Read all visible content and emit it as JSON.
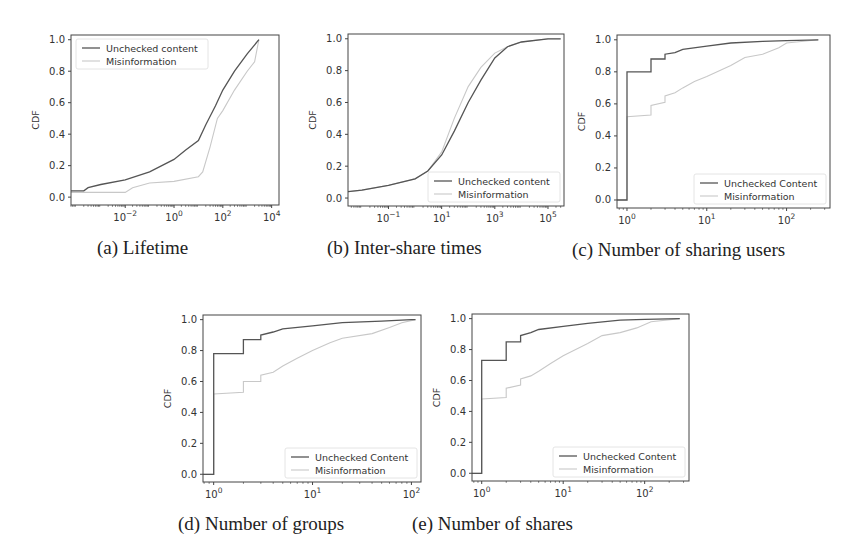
{
  "figure": {
    "colors": {
      "unchecked": "#555555",
      "misinformation": "#c8c8c8",
      "axis": "#444444",
      "background": "#ffffff"
    }
  },
  "chart_data": [
    {
      "id": "a",
      "type": "line",
      "caption": "(a) Lifetime",
      "title": "",
      "xlabel": "",
      "ylabel": "CDF",
      "xscale": "log",
      "xlim": [
        6e-05,
        20000
      ],
      "ylim": [
        -0.05,
        1.03
      ],
      "xticks": [
        "10^-2",
        "10^0",
        "10^2",
        "10^4"
      ],
      "yticks": [
        "0.0",
        "0.2",
        "0.4",
        "0.6",
        "0.8",
        "1.0"
      ],
      "legend": {
        "position": "upper left",
        "entries": [
          "Unchecked content",
          "Misinformation"
        ]
      },
      "grid": false,
      "series": [
        {
          "name": "Unchecked content",
          "x": [
            6e-05,
            0.0002,
            0.0003,
            0.001,
            0.01,
            0.1,
            1,
            3,
            10,
            20,
            50,
            100,
            300,
            1000,
            3000
          ],
          "y": [
            0.04,
            0.04,
            0.06,
            0.08,
            0.11,
            0.16,
            0.24,
            0.3,
            0.36,
            0.46,
            0.58,
            0.68,
            0.8,
            0.91,
            1.0
          ]
        },
        {
          "name": "Misinformation",
          "x": [
            6e-05,
            0.001,
            0.01,
            0.02,
            0.1,
            1,
            10,
            15,
            30,
            60,
            100,
            300,
            1000,
            2000,
            3000
          ],
          "y": [
            0.03,
            0.03,
            0.03,
            0.06,
            0.09,
            0.1,
            0.13,
            0.16,
            0.32,
            0.5,
            0.55,
            0.68,
            0.8,
            0.86,
            1.0
          ]
        }
      ]
    },
    {
      "id": "b",
      "type": "line",
      "caption": "(b) Inter-share times",
      "title": "",
      "xlabel": "",
      "ylabel": "CDF",
      "xscale": "log",
      "xlim": [
        0.003,
        400000
      ],
      "ylim": [
        -0.05,
        1.03
      ],
      "xticks": [
        "10^-1",
        "10^1",
        "10^3",
        "10^5"
      ],
      "yticks": [
        "0.0",
        "0.2",
        "0.4",
        "0.6",
        "0.8",
        "1.0"
      ],
      "legend": {
        "position": "lower right",
        "entries": [
          "Unchecked content",
          "Misinformation"
        ]
      },
      "grid": false,
      "series": [
        {
          "name": "Unchecked content",
          "x": [
            0.003,
            0.01,
            0.1,
            1,
            3,
            10,
            30,
            100,
            300,
            1000,
            3000,
            10000,
            100000,
            300000
          ],
          "y": [
            0.04,
            0.05,
            0.08,
            0.12,
            0.17,
            0.27,
            0.42,
            0.6,
            0.74,
            0.88,
            0.95,
            0.98,
            1.0,
            1.0
          ]
        },
        {
          "name": "Misinformation",
          "x": [
            0.003,
            0.01,
            0.1,
            1,
            3,
            10,
            30,
            100,
            300,
            1000,
            3000,
            10000,
            100000,
            300000
          ],
          "y": [
            0.04,
            0.05,
            0.08,
            0.12,
            0.17,
            0.29,
            0.5,
            0.7,
            0.82,
            0.91,
            0.95,
            0.98,
            1.0,
            1.0
          ]
        }
      ]
    },
    {
      "id": "c",
      "type": "line",
      "caption": "(c) Number of sharing users",
      "title": "",
      "xlabel": "",
      "ylabel": "CDF",
      "xscale": "log",
      "xlim": [
        0.75,
        350
      ],
      "ylim": [
        -0.05,
        1.03
      ],
      "xticks": [
        "10^0",
        "10^1",
        "10^2"
      ],
      "yticks": [
        "0.0",
        "0.2",
        "0.4",
        "0.6",
        "0.8",
        "1.0"
      ],
      "legend": {
        "position": "lower right",
        "entries": [
          "Unchecked Content",
          "Misinformation"
        ]
      },
      "grid": false,
      "series": [
        {
          "name": "Unchecked Content",
          "x": [
            0.75,
            1,
            1,
            2,
            2,
            3,
            3,
            4,
            5,
            10,
            20,
            50,
            100,
            250
          ],
          "y": [
            0.0,
            0.0,
            0.8,
            0.8,
            0.88,
            0.88,
            0.91,
            0.92,
            0.94,
            0.96,
            0.98,
            0.99,
            0.995,
            1.0
          ]
        },
        {
          "name": "Misinformation",
          "x": [
            0.75,
            1,
            1,
            2,
            2,
            3,
            3,
            4,
            5,
            7,
            10,
            20,
            30,
            50,
            80,
            100,
            250
          ],
          "y": [
            0.0,
            0.0,
            0.52,
            0.53,
            0.59,
            0.61,
            0.65,
            0.67,
            0.7,
            0.74,
            0.77,
            0.84,
            0.89,
            0.91,
            0.95,
            0.98,
            1.0
          ]
        }
      ]
    },
    {
      "id": "d",
      "type": "line",
      "caption": "(d) Number of groups",
      "title": "",
      "xlabel": "",
      "ylabel": "CDF",
      "xscale": "log",
      "xlim": [
        0.78,
        125
      ],
      "ylim": [
        -0.05,
        1.03
      ],
      "xticks": [
        "10^0",
        "10^1",
        "10^2"
      ],
      "yticks": [
        "0.0",
        "0.2",
        "0.4",
        "0.6",
        "0.8",
        "1.0"
      ],
      "legend": {
        "position": "lower right",
        "entries": [
          "Unchecked Content",
          "Misinformation"
        ]
      },
      "grid": false,
      "series": [
        {
          "name": "Unchecked Content",
          "x": [
            0.78,
            1,
            1,
            2,
            2,
            3,
            3,
            4,
            5,
            10,
            20,
            50,
            100,
            110
          ],
          "y": [
            0.0,
            0.0,
            0.78,
            0.78,
            0.87,
            0.87,
            0.9,
            0.92,
            0.94,
            0.96,
            0.98,
            0.99,
            1.0,
            1.0
          ]
        },
        {
          "name": "Misinformation",
          "x": [
            0.78,
            1,
            1,
            2,
            2,
            3,
            3,
            4,
            5,
            7,
            10,
            15,
            20,
            40,
            60,
            80,
            110
          ],
          "y": [
            0.0,
            0.0,
            0.52,
            0.53,
            0.6,
            0.6,
            0.64,
            0.66,
            0.7,
            0.75,
            0.8,
            0.85,
            0.88,
            0.91,
            0.95,
            0.98,
            1.0
          ]
        }
      ]
    },
    {
      "id": "e",
      "type": "line",
      "caption": "(e) Number of shares",
      "title": "",
      "xlabel": "",
      "ylabel": "CDF",
      "xscale": "log",
      "xlim": [
        0.76,
        350
      ],
      "ylim": [
        -0.05,
        1.03
      ],
      "xticks": [
        "10^0",
        "10^1",
        "10^2"
      ],
      "yticks": [
        "0.0",
        "0.2",
        "0.4",
        "0.6",
        "0.8",
        "1.0"
      ],
      "legend": {
        "position": "lower right",
        "entries": [
          "Unchecked Content",
          "Misinformation"
        ]
      },
      "grid": false,
      "series": [
        {
          "name": "Unchecked Content",
          "x": [
            0.76,
            1,
            1,
            2,
            2,
            3,
            3,
            4,
            5,
            10,
            20,
            50,
            100,
            270
          ],
          "y": [
            0.0,
            0.0,
            0.73,
            0.73,
            0.85,
            0.85,
            0.89,
            0.91,
            0.93,
            0.95,
            0.97,
            0.99,
            0.995,
            1.0
          ]
        },
        {
          "name": "Misinformation",
          "x": [
            0.76,
            1,
            1,
            2,
            2,
            3,
            3,
            4,
            5,
            7,
            10,
            20,
            30,
            50,
            80,
            120,
            270
          ],
          "y": [
            0.0,
            0.0,
            0.48,
            0.49,
            0.55,
            0.57,
            0.61,
            0.63,
            0.66,
            0.71,
            0.76,
            0.84,
            0.89,
            0.91,
            0.94,
            0.98,
            1.0
          ]
        }
      ]
    }
  ]
}
